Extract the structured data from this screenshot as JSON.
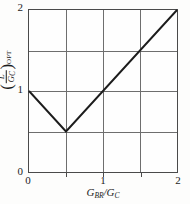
{
  "chart_data": {
    "type": "line",
    "title": "",
    "xlabel": "G_BR/G_C",
    "ylabel": "(L/G_C)_OPT",
    "xlim": [
      0,
      2
    ],
    "ylim": [
      0,
      2
    ],
    "grid": true,
    "legend": "none",
    "xticks": [
      0,
      0.5,
      1,
      1.5,
      2
    ],
    "yticks": [
      0,
      0.5,
      1,
      1.5,
      2
    ],
    "xticklabels": [
      "0",
      "",
      "1",
      "",
      "2"
    ],
    "yticklabels": [
      "0",
      "",
      "1",
      "",
      "2"
    ],
    "series": [
      {
        "name": "optimum curve",
        "x": [
          0,
          0.5,
          2
        ],
        "y": [
          1,
          0.5,
          2
        ],
        "color": "#1c1c1c",
        "style": "solid",
        "width": 1.6
      }
    ],
    "annotations": []
  },
  "axes": {
    "x": {
      "label_parts": {
        "symbol1": "G",
        "sub1": "BR",
        "slash": "/",
        "symbol2": "G",
        "sub2": "C"
      },
      "ticks": [
        {
          "value": 0,
          "label": "0",
          "pos_pct": 0
        },
        {
          "value": 0.5,
          "label": "",
          "pos_pct": 25
        },
        {
          "value": 1,
          "label": "1",
          "pos_pct": 50
        },
        {
          "value": 1.5,
          "label": "",
          "pos_pct": 75
        },
        {
          "value": 2,
          "label": "2",
          "pos_pct": 100
        }
      ]
    },
    "y": {
      "label_parts": {
        "open_paren": "(",
        "numerator": "L",
        "denominator_symbol": "G",
        "denominator_sub": "C",
        "close_paren": ")",
        "outer_sub": "OPT"
      },
      "ticks": [
        {
          "value": 0,
          "label": "0",
          "pos_pct": 100
        },
        {
          "value": 0.5,
          "label": "",
          "pos_pct": 75
        },
        {
          "value": 1,
          "label": "1",
          "pos_pct": 50
        },
        {
          "value": 1.5,
          "label": "",
          "pos_pct": 25
        },
        {
          "value": 2,
          "label": "2",
          "pos_pct": 0
        }
      ]
    }
  },
  "colors": {
    "background": "#fdfdfc",
    "plot_background": "#fefefe",
    "frame": "#4a4a4a",
    "grid": "#6e6e6e",
    "curve": "#1c1c1c",
    "text": "#1c1c1c"
  }
}
